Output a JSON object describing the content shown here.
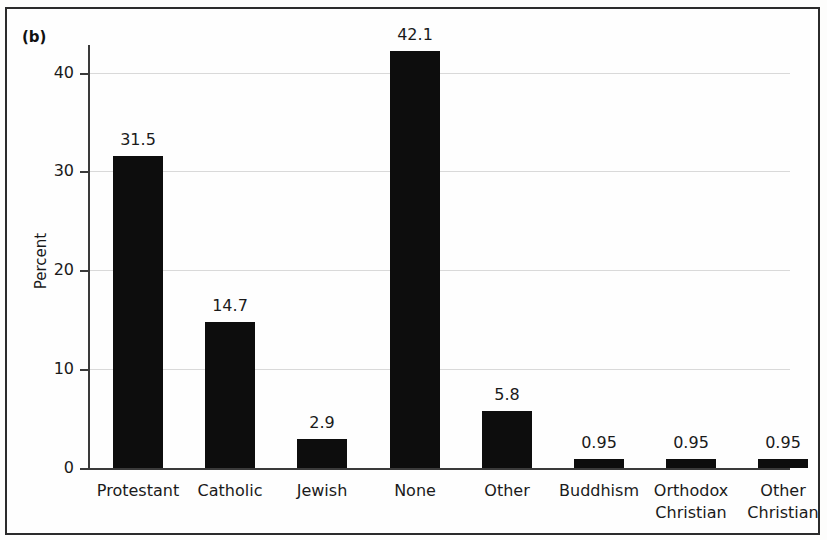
{
  "figure": {
    "panel_label": "(b)"
  },
  "chart_data": {
    "type": "bar",
    "title": "",
    "xlabel": "",
    "ylabel": "Percent",
    "ylim": [
      0,
      45
    ],
    "yticks": [
      0,
      10,
      20,
      30,
      40
    ],
    "ytick_labels": [
      "0",
      "10",
      "20",
      "30",
      "40"
    ],
    "grid": true,
    "legend": "none",
    "categories": [
      "Protestant",
      "Catholic",
      "Jewish",
      "None",
      "Other",
      "Buddhism",
      "Orthodox Christian",
      "Other Christian"
    ],
    "category_lines": [
      [
        "Protestant"
      ],
      [
        "Catholic"
      ],
      [
        "Jewish"
      ],
      [
        "None"
      ],
      [
        "Other"
      ],
      [
        "Buddhism"
      ],
      [
        "Orthodox",
        "Christian"
      ],
      [
        "Other",
        "Christian"
      ]
    ],
    "values": [
      31.5,
      14.7,
      2.9,
      42.1,
      5.8,
      0.95,
      0.95,
      0.95
    ],
    "value_labels": [
      "31.5",
      "14.7",
      "2.9",
      "42.1",
      "5.8",
      "0.95",
      "0.95",
      "0.95"
    ],
    "bar_color": "#0d0d0d",
    "grid_color": "#d9d9d9",
    "axis_color": "#3a3a3a"
  }
}
